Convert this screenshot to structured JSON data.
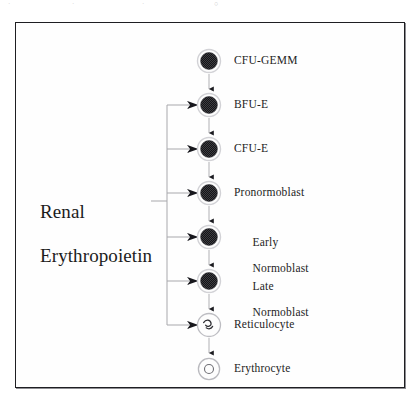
{
  "figure": {
    "background_color": "#ffffff",
    "frame_color": "#1e1e22",
    "line_color": "#a8a8ac",
    "arrow_color": "#15151a",
    "cell_fill_color": "#3b3b3f",
    "cell_ring_color": "#d2d2d6"
  },
  "regulator": {
    "name": "renal-erythropoietin",
    "text": "Renal\nErythropoietin",
    "line1": "Renal",
    "line2": "Erythropoietin"
  },
  "lineage": {
    "label": "Erythroid maturation sequence",
    "stages": [
      {
        "id": "cfu-gemm",
        "label": "CFU-GEMM",
        "glyph": "nucleated-cell",
        "cy": 38,
        "radius": 11,
        "epo_stimulated": false,
        "label_lines": [
          "CFU-GEMM"
        ]
      },
      {
        "id": "bfu-e",
        "label": "BFU-E",
        "glyph": "nucleated-cell",
        "cy": 82,
        "radius": 11,
        "epo_stimulated": true,
        "label_lines": [
          "BFU-E"
        ]
      },
      {
        "id": "cfu-e",
        "label": "CFU-E",
        "glyph": "nucleated-cell",
        "cy": 126,
        "radius": 11,
        "epo_stimulated": true,
        "label_lines": [
          "CFU-E"
        ]
      },
      {
        "id": "pronormoblast",
        "label": "Pronormoblast",
        "glyph": "nucleated-cell",
        "cy": 170,
        "radius": 11,
        "epo_stimulated": true,
        "label_lines": [
          "Pronormoblast"
        ]
      },
      {
        "id": "early-normoblast",
        "label": "Early Normoblast",
        "glyph": "nucleated-cell",
        "cy": 214,
        "radius": 11,
        "epo_stimulated": true,
        "label_lines": [
          "Early",
          "Normoblast"
        ]
      },
      {
        "id": "late-normoblast",
        "label": "Late Normoblast",
        "glyph": "nucleated-cell",
        "cy": 258,
        "radius": 11,
        "epo_stimulated": true,
        "label_lines": [
          "Late",
          "Normoblast"
        ]
      },
      {
        "id": "reticulocyte",
        "label": "Reticulocyte",
        "glyph": "reticular-cell",
        "cy": 302,
        "radius": 11,
        "epo_stimulated": true,
        "label_lines": [
          "Reticulocyte"
        ]
      },
      {
        "id": "erythrocyte",
        "label": "Erythrocyte",
        "glyph": "biconcave-disc",
        "cy": 346,
        "radius": 10,
        "epo_stimulated": false,
        "label_lines": [
          "Erythrocyte"
        ]
      }
    ]
  },
  "scan_artifacts": {
    "a1": "·",
    "a2": "·",
    "a3": "·",
    "a4": "○"
  }
}
